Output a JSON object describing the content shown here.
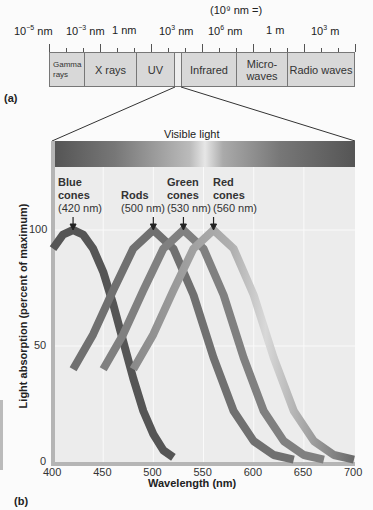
{
  "panel_a": {
    "label": "(a)",
    "scale_note": "(10⁹ nm =)",
    "scale_ticks": [
      {
        "base": "10",
        "exp": "−5",
        "unit": " nm",
        "x": 30
      },
      {
        "base": "10",
        "exp": "−3",
        "unit": " nm",
        "x": 82
      },
      {
        "base": "",
        "exp": "",
        "unit": "1 nm",
        "x": 128
      },
      {
        "base": "10",
        "exp": "3",
        "unit": " nm",
        "x": 175
      },
      {
        "base": "10",
        "exp": "6",
        "unit": " nm",
        "x": 224
      },
      {
        "base": "",
        "exp": "",
        "unit": "1 m",
        "x": 282
      },
      {
        "base": "10",
        "exp": "3",
        "unit": " m",
        "x": 327
      }
    ],
    "bands": [
      {
        "name": "Gamma rays",
        "label_line1": "Gamma",
        "label_line2": "rays"
      },
      {
        "name": "X rays",
        "label": "X rays"
      },
      {
        "name": "UV",
        "label": "UV"
      },
      {
        "name": "Visible",
        "label": ""
      },
      {
        "name": "Infrared",
        "label": "Infrared"
      },
      {
        "name": "Microwaves",
        "label_line1": "Micro-",
        "label_line2": "waves"
      },
      {
        "name": "Radio waves",
        "label": "Radio waves"
      }
    ]
  },
  "panel_b": {
    "label": "(b)",
    "visible_light_label": "Visible light",
    "cones": [
      {
        "name": "Blue",
        "line1": "Blue",
        "line2": "cones",
        "peak": "(420 nm)"
      },
      {
        "name": "Rods",
        "line1": "",
        "line2": "Rods",
        "peak": "(500 nm)"
      },
      {
        "name": "Green",
        "line1": "Green",
        "line2": "cones",
        "peak": "(530 nm)"
      },
      {
        "name": "Red",
        "line1": "Red",
        "line2": "cones",
        "peak": "(560 nm)"
      }
    ]
  },
  "chart_data": {
    "type": "line",
    "title": "",
    "xlabel": "Wavelength (nm)",
    "ylabel": "Light absorption (percent of maximum)",
    "xlim": [
      400,
      700
    ],
    "ylim": [
      0,
      100
    ],
    "x_ticks": [
      "400",
      "450",
      "500",
      "550",
      "600",
      "650",
      "700"
    ],
    "y_ticks": [
      "0",
      "50",
      "100"
    ],
    "grid": true,
    "series": [
      {
        "name": "Blue cones",
        "peak_nm": 420,
        "color": "#555555",
        "x": [
          400,
          410,
          420,
          430,
          440,
          450,
          460,
          470,
          480,
          490,
          500,
          510,
          520
        ],
        "y": [
          92,
          98,
          100,
          98,
          92,
          82,
          68,
          52,
          36,
          22,
          12,
          5,
          2
        ]
      },
      {
        "name": "Rods",
        "peak_nm": 500,
        "color": "#707070",
        "x": [
          420,
          440,
          460,
          480,
          500,
          520,
          540,
          560,
          580,
          600,
          620,
          640
        ],
        "y": [
          40,
          55,
          74,
          92,
          100,
          92,
          72,
          45,
          22,
          9,
          3,
          1
        ]
      },
      {
        "name": "Green cones",
        "peak_nm": 530,
        "color": "#808080",
        "x": [
          450,
          470,
          490,
          510,
          530,
          550,
          570,
          590,
          610,
          630,
          650,
          670
        ],
        "y": [
          40,
          55,
          74,
          92,
          100,
          92,
          72,
          45,
          22,
          9,
          3,
          1
        ]
      },
      {
        "name": "Red cones",
        "peak_nm": 560,
        "color": "#999999",
        "x": [
          480,
          500,
          520,
          540,
          560,
          580,
          600,
          620,
          640,
          660,
          680,
          700
        ],
        "y": [
          40,
          55,
          74,
          92,
          100,
          92,
          72,
          45,
          22,
          9,
          3,
          1
        ]
      }
    ]
  }
}
